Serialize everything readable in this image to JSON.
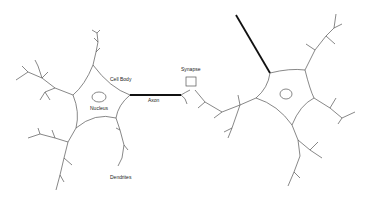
{
  "labels": {
    "cell_body": "Cell Body",
    "nucleus": "Nucleus",
    "axon": "Axon",
    "synapse": "Synapse",
    "dendrites": "Dendrites"
  },
  "colors": {
    "line": "#555555",
    "axon": "#111111",
    "background": "#ffffff"
  }
}
